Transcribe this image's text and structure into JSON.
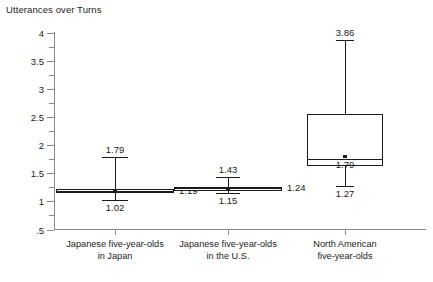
{
  "chart_data": {
    "type": "box",
    "title": "Utterances over Turns",
    "xlabel": "",
    "ylabel": "Utterances over Turns",
    "ylim": [
      0.5,
      4
    ],
    "ytick_labels": [
      "4",
      "3.5",
      "3",
      "2.5",
      "2",
      "1.5",
      "1",
      ".5"
    ],
    "ytick_values": [
      4,
      3.5,
      3,
      2.5,
      2,
      1.5,
      1,
      0.5
    ],
    "grid": false,
    "legend": "none",
    "categories": [
      "Japanese five-year-olds in Japan",
      "Japanese five-year-olds in the U.S.",
      "North American five-year-olds"
    ],
    "category_lines": [
      [
        "Japanese five-year-olds",
        "in Japan"
      ],
      [
        "Japanese five-year-olds",
        "in the U.S."
      ],
      [
        "North American",
        "five-year-olds"
      ]
    ],
    "series": [
      {
        "name": "Japanese five-year-olds in Japan",
        "max": 1.79,
        "q3": 1.22,
        "median": 1.19,
        "mean": 1.17,
        "q1": 1.14,
        "min": 1.02,
        "labels": {
          "max": "1.79",
          "median": "1.19",
          "min": "1.02"
        }
      },
      {
        "name": "Japanese five-year-olds in the U.S.",
        "max": 1.43,
        "q3": 1.26,
        "median": 1.24,
        "mean": 1.21,
        "q1": 1.18,
        "min": 1.15,
        "labels": {
          "max": "1.43",
          "median": "1.24",
          "min": "1.15"
        }
      },
      {
        "name": "North American five-year-olds",
        "max": 3.86,
        "q3": 2.55,
        "median": 1.75,
        "mean": 1.79,
        "q1": 1.63,
        "min": 1.27,
        "labels": {
          "max": "3.86",
          "median": "1.79",
          "min": "1.27"
        }
      }
    ]
  },
  "caption": ""
}
